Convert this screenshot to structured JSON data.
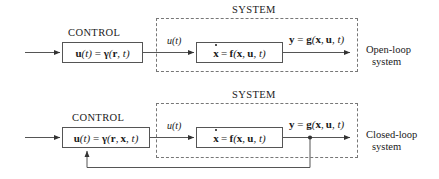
{
  "diagram": {
    "title_implicit": "Open-loop and closed-loop control block diagrams",
    "system_label": "SYSTEM",
    "control_label": "CONTROL",
    "signal_u": "u(t)",
    "plant_lhs": "x",
    "plant_rhs": "f(x, u, t)",
    "output_lhs": "y",
    "output_rhs": "g(x, u, t)"
  },
  "rows": [
    {
      "id": "open-loop",
      "control_title": "CONTROL",
      "control_eq_lhs": "u(t)",
      "control_eq_rhs_args": "(r, t)",
      "system_title": "SYSTEM",
      "signal_label": "u(t)",
      "plant_eq_lhs": "x",
      "plant_eq_rhs": "f(x, u, t)",
      "output_eq_lhs": "y",
      "output_eq_rhs": "g(x, u, t)",
      "caption_line1": "Open-loop",
      "caption_line2": "system",
      "has_feedback": false
    },
    {
      "id": "closed-loop",
      "control_title": "CONTROL",
      "control_eq_lhs": "u(t)",
      "control_eq_rhs_args": "(r, x, t)",
      "system_title": "SYSTEM",
      "signal_label": "u(t)",
      "plant_eq_lhs": "x",
      "plant_eq_rhs": "f(x, u, t)",
      "output_eq_lhs": "y",
      "output_eq_rhs": "g(x, u, t)",
      "caption_line1": "Closed-loop",
      "caption_line2": "system",
      "has_feedback": true
    }
  ],
  "symbols": {
    "gamma": "γ",
    "equals": "=",
    "bold_r": "r",
    "bold_x": "x",
    "bold_u": "u",
    "bold_y": "y",
    "bold_f": "f",
    "bold_g": "g",
    "italic_t": "t"
  },
  "colors": {
    "line": "#555555",
    "dashed": "#777777",
    "text": "#1a1a1a",
    "background": "#ffffff"
  }
}
